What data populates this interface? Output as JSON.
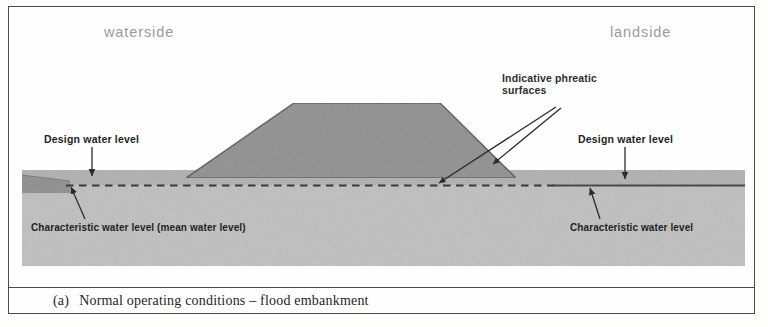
{
  "figure": {
    "domain": "engineering-cross-section-diagram",
    "caption_index": "(a)",
    "caption_text": "Normal operating conditions – flood embankment"
  },
  "labels": {
    "waterside": "waterside",
    "landside": "landside",
    "phreatic_line1": "Indicative phreatic",
    "phreatic_line2": "surfaces",
    "design_water_level_left": "Design water level",
    "design_water_level_right": "Design water level",
    "characteristic_water_level_left": "Characteristic water level (mean water level)",
    "characteristic_water_level_right": "Characteristic water level"
  },
  "colors": {
    "page_background": "#fdfdfc",
    "frame_border": "#4c4c4c",
    "ground_fill": "#bcbcbc",
    "ground_top_band": "#acacac",
    "embankment_fill": "#8e8e8e",
    "embankment_outline": "#5a5a5a",
    "water_body_fill": "#8f8f8f",
    "phreatic_line": "#3a3a3a",
    "solid_water_line": "#4a4a4a",
    "arrow_stroke": "#2b2b2b",
    "side_label_text": "#9a9a9a",
    "callout_text": "#2e2e2e",
    "caption_text": "#1e1e1e"
  },
  "geometry": {
    "canvas": {
      "width": 768,
      "height": 327
    },
    "frame": {
      "x": 8,
      "y": 6,
      "width": 747,
      "height": 308
    },
    "ground": {
      "x": 22,
      "y": 170,
      "width": 723,
      "height": 96
    },
    "ground_top_band": {
      "x": 22,
      "y": 170,
      "width": 723,
      "height": 14
    },
    "embankment_trapezoid": {
      "left_toe": [
        186,
        178
      ],
      "crest_left": [
        294,
        103
      ],
      "crest_right": [
        440,
        103
      ],
      "right_toe": [
        516,
        178
      ]
    },
    "water_body_wedge": {
      "x": 22,
      "y": 176,
      "width": 48,
      "height": 16
    },
    "phreatic_dashed_line": {
      "x1": 70,
      "y1": 185,
      "x2": 556,
      "y2": 185
    },
    "landside_solid_line": {
      "x1": 556,
      "y1": 185,
      "x2": 745,
      "y2": 185
    },
    "caption_bar": {
      "x": 9,
      "y": 287,
      "width": 745,
      "height": 26
    }
  },
  "annotations": {
    "arrow_dwl_left": {
      "from": [
        92,
        148
      ],
      "to": [
        92,
        178
      ]
    },
    "arrow_dwl_right": {
      "from": [
        624,
        148
      ],
      "to": [
        624,
        180
      ]
    },
    "arrow_cwl_left": {
      "from": [
        86,
        218
      ],
      "to": [
        72,
        188
      ]
    },
    "arrow_cwl_right": {
      "from": [
        598,
        218
      ],
      "to": [
        590,
        188
      ]
    },
    "leader_phreatic_long": {
      "from": [
        556,
        108
      ],
      "to": [
        438,
        184
      ]
    },
    "leader_phreatic_short": {
      "from": [
        560,
        108
      ],
      "to": [
        492,
        166
      ]
    }
  }
}
